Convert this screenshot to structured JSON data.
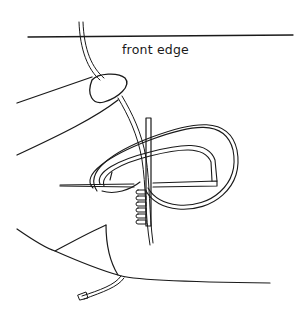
{
  "diagram": {
    "labels": {
      "edge": "front edge"
    },
    "colors": {
      "ink": "#1a1a1a",
      "paper": "#ffffff"
    },
    "elements": [
      "front-edge-line",
      "thread",
      "thumb",
      "fingernail",
      "needle",
      "thread-loop",
      "blanket-stitches",
      "fabric-fold",
      "thread-tail"
    ]
  }
}
